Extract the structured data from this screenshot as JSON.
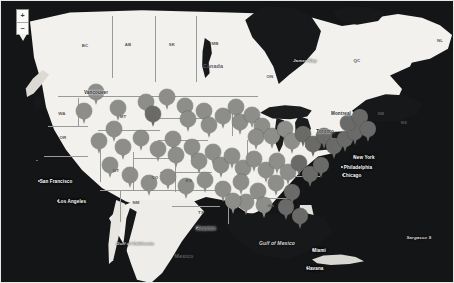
{
  "map": {
    "title": "North America Map with Location Pins",
    "colors": {
      "ocean": "#141517",
      "land": "#f2f1ed",
      "pin": "#7c7c7a",
      "border": "#9a9a96"
    },
    "zoom_control": {
      "zoom_in_label": "+",
      "zoom_out_label": "−"
    },
    "province_labels": [
      {
        "text": "BC",
        "x": 85,
        "y": 45
      },
      {
        "text": "AB",
        "x": 128,
        "y": 44
      },
      {
        "text": "SK",
        "x": 172,
        "y": 44
      },
      {
        "text": "MB",
        "x": 215,
        "y": 43
      },
      {
        "text": "ON",
        "x": 270,
        "y": 76
      },
      {
        "text": "QC",
        "x": 357,
        "y": 60
      },
      {
        "text": "NL",
        "x": 440,
        "y": 40
      },
      {
        "text": "NB",
        "x": 381,
        "y": 113
      },
      {
        "text": "NS",
        "x": 404,
        "y": 122
      }
    ],
    "state_labels": [
      {
        "text": "WA",
        "x": 62,
        "y": 113
      },
      {
        "text": "OR",
        "x": 63,
        "y": 137
      },
      {
        "text": "MT",
        "x": 123,
        "y": 116
      },
      {
        "text": "UT",
        "x": 116,
        "y": 170
      },
      {
        "text": "CO",
        "x": 155,
        "y": 177
      },
      {
        "text": "NM",
        "x": 136,
        "y": 202
      },
      {
        "text": "TX",
        "x": 201,
        "y": 212
      },
      {
        "text": "KS",
        "x": 189,
        "y": 180
      },
      {
        "text": "GA",
        "x": 271,
        "y": 205
      }
    ],
    "country_labels": [
      {
        "text": "Canada",
        "x": 213,
        "y": 66
      },
      {
        "text": "Mexico",
        "x": 184,
        "y": 256
      }
    ],
    "city_labels": [
      {
        "text": "Vancouver",
        "x": 96,
        "y": 92,
        "style": "city-light",
        "dot": true
      },
      {
        "text": "San Francisco",
        "x": 56,
        "y": 181,
        "style": "city-dark",
        "dot": true
      },
      {
        "text": "Los Angeles",
        "x": 72,
        "y": 201,
        "style": "city-dark",
        "dot": true
      },
      {
        "text": "Houston",
        "x": 206,
        "y": 228,
        "style": "city-light",
        "dot": true
      },
      {
        "text": "Toronto",
        "x": 325,
        "y": 131,
        "style": "city-light",
        "dot": true
      },
      {
        "text": "Montreal",
        "x": 341,
        "y": 113,
        "style": "city-light",
        "dot": true
      },
      {
        "text": "New York",
        "x": 364,
        "y": 157,
        "style": "city-dark",
        "dot": true
      },
      {
        "text": "Philadelphia",
        "x": 358,
        "y": 167,
        "style": "city-dark",
        "dot": true
      },
      {
        "text": "Chicago",
        "x": 352,
        "y": 175,
        "style": "city-dark",
        "dot": true
      },
      {
        "text": "Miami",
        "x": 319,
        "y": 250,
        "style": "city-dark",
        "dot": true
      },
      {
        "text": "Havana",
        "x": 315,
        "y": 268,
        "style": "city-dark",
        "dot": true
      }
    ],
    "water_labels": [
      {
        "text": "James Bay",
        "x": 305,
        "y": 60,
        "size": "small"
      },
      {
        "text": "Gulf of Mexico",
        "x": 277,
        "y": 243,
        "size": "normal"
      },
      {
        "text": "Gulf of California",
        "x": 135,
        "y": 243,
        "size": "small"
      },
      {
        "text": "Sargasso S",
        "x": 419,
        "y": 237,
        "size": "small"
      }
    ],
    "pins": [
      {
        "x": 96,
        "y": 103,
        "tone": "light"
      },
      {
        "x": 84,
        "y": 122,
        "tone": "light"
      },
      {
        "x": 118,
        "y": 119,
        "tone": "light"
      },
      {
        "x": 146,
        "y": 113,
        "tone": "light"
      },
      {
        "x": 153,
        "y": 125,
        "tone": "dark"
      },
      {
        "x": 167,
        "y": 108,
        "tone": "light"
      },
      {
        "x": 185,
        "y": 117,
        "tone": "light"
      },
      {
        "x": 188,
        "y": 130,
        "tone": "light"
      },
      {
        "x": 204,
        "y": 122,
        "tone": "light"
      },
      {
        "x": 209,
        "y": 136,
        "tone": "light"
      },
      {
        "x": 223,
        "y": 127,
        "tone": "light"
      },
      {
        "x": 236,
        "y": 118,
        "tone": "light"
      },
      {
        "x": 240,
        "y": 133,
        "tone": "light"
      },
      {
        "x": 252,
        "y": 126,
        "tone": "light"
      },
      {
        "x": 262,
        "y": 137,
        "tone": "light"
      },
      {
        "x": 256,
        "y": 148,
        "tone": "light"
      },
      {
        "x": 272,
        "y": 147,
        "tone": "light"
      },
      {
        "x": 285,
        "y": 140,
        "tone": "light"
      },
      {
        "x": 292,
        "y": 152,
        "tone": "light"
      },
      {
        "x": 303,
        "y": 145,
        "tone": "dark"
      },
      {
        "x": 313,
        "y": 155,
        "tone": "dark"
      },
      {
        "x": 324,
        "y": 147,
        "tone": "dark"
      },
      {
        "x": 334,
        "y": 157,
        "tone": "dark"
      },
      {
        "x": 345,
        "y": 150,
        "tone": "dark"
      },
      {
        "x": 355,
        "y": 143,
        "tone": "dark"
      },
      {
        "x": 348,
        "y": 134,
        "tone": "dark"
      },
      {
        "x": 360,
        "y": 128,
        "tone": "dark"
      },
      {
        "x": 368,
        "y": 140,
        "tone": "dark"
      },
      {
        "x": 114,
        "y": 140,
        "tone": "light"
      },
      {
        "x": 99,
        "y": 152,
        "tone": "light"
      },
      {
        "x": 123,
        "y": 158,
        "tone": "light"
      },
      {
        "x": 141,
        "y": 149,
        "tone": "light"
      },
      {
        "x": 158,
        "y": 160,
        "tone": "light"
      },
      {
        "x": 173,
        "y": 150,
        "tone": "light"
      },
      {
        "x": 176,
        "y": 166,
        "tone": "light"
      },
      {
        "x": 192,
        "y": 158,
        "tone": "light"
      },
      {
        "x": 199,
        "y": 172,
        "tone": "light"
      },
      {
        "x": 213,
        "y": 163,
        "tone": "light"
      },
      {
        "x": 221,
        "y": 176,
        "tone": "light"
      },
      {
        "x": 232,
        "y": 167,
        "tone": "light"
      },
      {
        "x": 243,
        "y": 179,
        "tone": "light"
      },
      {
        "x": 254,
        "y": 170,
        "tone": "light"
      },
      {
        "x": 266,
        "y": 181,
        "tone": "light"
      },
      {
        "x": 277,
        "y": 172,
        "tone": "light"
      },
      {
        "x": 288,
        "y": 183,
        "tone": "light"
      },
      {
        "x": 299,
        "y": 174,
        "tone": "dark"
      },
      {
        "x": 310,
        "y": 185,
        "tone": "dark"
      },
      {
        "x": 321,
        "y": 176,
        "tone": "dark"
      },
      {
        "x": 110,
        "y": 176,
        "tone": "light"
      },
      {
        "x": 130,
        "y": 186,
        "tone": "light"
      },
      {
        "x": 149,
        "y": 194,
        "tone": "light"
      },
      {
        "x": 168,
        "y": 188,
        "tone": "light"
      },
      {
        "x": 186,
        "y": 197,
        "tone": "light"
      },
      {
        "x": 205,
        "y": 191,
        "tone": "light"
      },
      {
        "x": 223,
        "y": 200,
        "tone": "light"
      },
      {
        "x": 241,
        "y": 193,
        "tone": "light"
      },
      {
        "x": 258,
        "y": 202,
        "tone": "light"
      },
      {
        "x": 276,
        "y": 194,
        "tone": "light"
      },
      {
        "x": 292,
        "y": 203,
        "tone": "dark"
      },
      {
        "x": 246,
        "y": 213,
        "tone": "light"
      },
      {
        "x": 264,
        "y": 216,
        "tone": "light"
      },
      {
        "x": 286,
        "y": 218,
        "tone": "dark"
      },
      {
        "x": 300,
        "y": 227,
        "tone": "dark"
      },
      {
        "x": 233,
        "y": 212,
        "tone": "light"
      }
    ]
  }
}
